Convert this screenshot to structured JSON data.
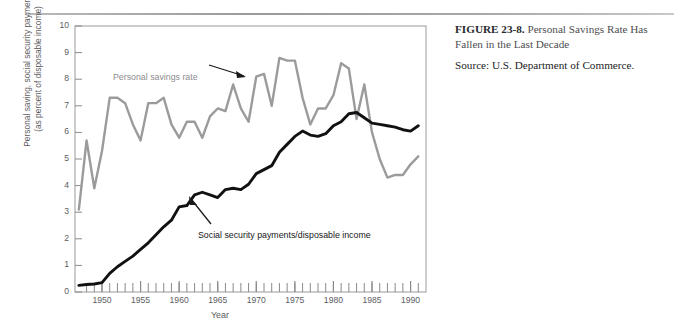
{
  "caption": {
    "figure_number": "FIGURE 23-8.",
    "title": "Personal Savings Rate Has Fallen in the Last Decade",
    "source": "Source: U.S. Department of Commerce."
  },
  "annotations": {
    "savings": "Personal savings rate",
    "social": "Social security payments/disposable income"
  },
  "chart_data": {
    "type": "line",
    "title": "Personal Savings Rate Has Fallen in the Last Decade",
    "xlabel": "Year",
    "ylabel": "Personal saving, social security payments (as percent of disposable income)",
    "ylabel_line1": "Personal saving, social security payments",
    "ylabel_line2": "(as percent of disposable income)",
    "xlim": [
      1946.5,
      1992
    ],
    "ylim": [
      0,
      10
    ],
    "yticks": [
      0,
      1,
      2,
      3,
      4,
      5,
      6,
      7,
      8,
      9,
      10
    ],
    "ytick_labels": [
      "0",
      "1",
      "2",
      "3",
      "4",
      "5",
      "6",
      "7",
      "8",
      "9",
      "10"
    ],
    "xticks": [
      1950,
      1955,
      1960,
      1965,
      1970,
      1975,
      1980,
      1985,
      1990
    ],
    "xtick_labels": [
      "1950",
      "1955",
      "1960",
      "1965",
      "1970",
      "1975",
      "1980",
      "1985",
      "1990"
    ],
    "x_minor_tick_step": 1,
    "grid": false,
    "legend": "annotations-inline",
    "colors": {
      "personal_savings_rate": "#9b9b9d",
      "social_security": "#111114",
      "axis": "#8a8a8c",
      "text": "#5d5d5f"
    },
    "x": [
      1947,
      1948,
      1949,
      1950,
      1951,
      1952,
      1953,
      1954,
      1955,
      1956,
      1957,
      1958,
      1959,
      1960,
      1961,
      1962,
      1963,
      1964,
      1965,
      1966,
      1967,
      1968,
      1969,
      1970,
      1971,
      1972,
      1973,
      1974,
      1975,
      1976,
      1977,
      1978,
      1979,
      1980,
      1981,
      1982,
      1983,
      1984,
      1985,
      1986,
      1987,
      1988,
      1989,
      1990,
      1991
    ],
    "series": [
      {
        "name": "Personal savings rate",
        "color": "#9b9b9d",
        "values": [
          3.1,
          5.7,
          3.9,
          5.3,
          7.3,
          7.3,
          7.1,
          6.3,
          5.7,
          7.1,
          7.1,
          7.3,
          6.3,
          5.8,
          6.4,
          6.4,
          5.8,
          6.6,
          6.9,
          6.8,
          7.8,
          6.9,
          6.4,
          8.1,
          8.2,
          7.0,
          8.8,
          8.7,
          8.7,
          7.3,
          6.3,
          6.9,
          6.9,
          7.4,
          8.6,
          8.4,
          6.5,
          7.8,
          6.0,
          5.0,
          4.3,
          4.4,
          4.4,
          4.8,
          5.1
        ]
      },
      {
        "name": "Social security payments/disposable income",
        "color": "#111114",
        "values": [
          0.25,
          0.28,
          0.3,
          0.35,
          0.7,
          0.95,
          1.15,
          1.35,
          1.6,
          1.85,
          2.15,
          2.45,
          2.7,
          3.2,
          3.25,
          3.65,
          3.75,
          3.65,
          3.55,
          3.85,
          3.9,
          3.85,
          4.05,
          4.45,
          4.6,
          4.75,
          5.25,
          5.55,
          5.85,
          6.05,
          5.9,
          5.85,
          5.95,
          6.25,
          6.4,
          6.7,
          6.75,
          6.55,
          6.35,
          6.3,
          6.25,
          6.2,
          6.1,
          6.05,
          6.25
        ]
      }
    ]
  }
}
